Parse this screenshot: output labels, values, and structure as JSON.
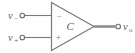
{
  "figure": {
    "type": "circuit-diagram",
    "background_color": "#fefefe",
    "stroke_color": "#7a7a7a",
    "text_color": "#5f5f5f",
    "output_wire_color": "#8e8e8e"
  },
  "amplifier": {
    "body_label": "C",
    "inverting_sign": "−",
    "noninverting_sign": "+"
  },
  "inputs": [
    {
      "id": "inverting",
      "base": "v",
      "subscript": "−",
      "terminal": "open-circle"
    },
    {
      "id": "noninverting",
      "base": "v",
      "subscript": "+",
      "terminal": "open-circle"
    }
  ],
  "output": {
    "id": "output",
    "base": "v",
    "subscript": "o",
    "terminal": "open-circle"
  }
}
